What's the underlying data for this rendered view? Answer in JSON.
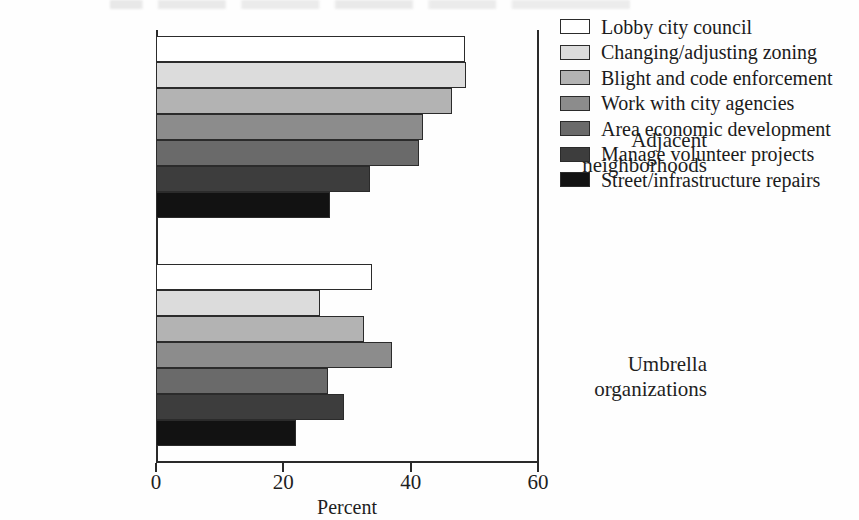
{
  "chart_data": {
    "type": "bar",
    "orientation": "horizontal",
    "title": "",
    "xlabel": "Percent",
    "ylabel": "",
    "xlim": [
      0,
      60
    ],
    "xticks": [
      0,
      20,
      40,
      60
    ],
    "xtick_labels": [
      "0",
      "20",
      "40",
      "60"
    ],
    "grid": false,
    "legend_position": "right",
    "categories": [
      "Adjacent\nneighborhoods",
      "Umbrella\norganizations"
    ],
    "series": [
      {
        "name": "Lobby city council",
        "color": "#ffffff",
        "values": [
          48.5,
          34.0
        ]
      },
      {
        "name": "Changing/adjusting zoning",
        "color": "#dcdcdc",
        "values": [
          48.7,
          25.8
        ]
      },
      {
        "name": "Blight and code enforcement",
        "color": "#b3b3b3",
        "values": [
          46.5,
          32.6
        ]
      },
      {
        "name": "Work with city agencies",
        "color": "#8c8c8c",
        "values": [
          42.0,
          37.0
        ]
      },
      {
        "name": "Area economic development",
        "color": "#6a6a6a",
        "values": [
          41.3,
          27.0
        ]
      },
      {
        "name": "Manage volunteer projects",
        "color": "#3d3d3d",
        "values": [
          33.6,
          29.5
        ]
      },
      {
        "name": "Street/infrastructure repairs",
        "color": "#121212",
        "values": [
          27.3,
          22.0
        ]
      }
    ]
  },
  "axis": {
    "x_title": "Percent",
    "tick_labels": [
      "0",
      "20",
      "40",
      "60"
    ]
  },
  "groups": [
    {
      "label": "Adjacent\nneighborhoods"
    },
    {
      "label": "Umbrella\norganizations"
    }
  ],
  "legend": {
    "items": [
      {
        "label": "Lobby city council",
        "color": "#ffffff"
      },
      {
        "label": "Changing/adjusting zoning",
        "color": "#dcdcdc"
      },
      {
        "label": "Blight and code enforcement",
        "color": "#b3b3b3"
      },
      {
        "label": "Work with city agencies",
        "color": "#8c8c8c"
      },
      {
        "label": "Area economic development",
        "color": "#6a6a6a"
      },
      {
        "label": "Manage volunteer projects",
        "color": "#3d3d3d"
      },
      {
        "label": "Street/infrastructure repairs",
        "color": "#121212"
      }
    ]
  }
}
